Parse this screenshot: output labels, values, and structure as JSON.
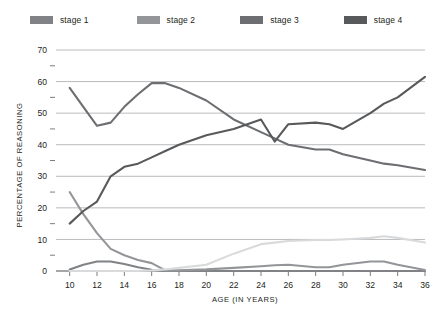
{
  "legend": {
    "position": "top",
    "items": [
      {
        "label": "stage 1",
        "color": "#808285"
      },
      {
        "label": "stage 2",
        "color": "#939598"
      },
      {
        "label": "stage 3",
        "color": "#6d6e71"
      },
      {
        "label": "stage 4",
        "color": "#58595b"
      },
      {
        "label": "stage 5",
        "color": "#d9dadb"
      }
    ]
  },
  "axes": {
    "y_title": "PERCENTAGE OF REASONING",
    "x_title": "AGE (IN YEARS)",
    "y_ticks": [
      "0",
      "10",
      "20",
      "30",
      "40",
      "50",
      "60",
      "70"
    ],
    "x_ticks": [
      "10",
      "12",
      "14",
      "16",
      "18",
      "20",
      "22",
      "24",
      "26",
      "28",
      "30",
      "32",
      "34",
      "36"
    ]
  },
  "chart_data": {
    "type": "line",
    "title": "",
    "xlabel": "AGE (IN YEARS)",
    "ylabel": "PERCENTAGE OF REASONING",
    "xlim": [
      9,
      36
    ],
    "ylim": [
      0,
      70
    ],
    "grid": true,
    "legend_position": "top",
    "x": [
      10,
      11,
      12,
      13,
      14,
      15,
      16,
      17,
      18,
      20,
      22,
      24,
      25,
      26,
      28,
      29,
      30,
      32,
      33,
      34,
      36
    ],
    "series": [
      {
        "name": "stage 1",
        "color": "#808285",
        "values": [
          0.5,
          2.0,
          3.0,
          3.0,
          2.2,
          1.2,
          0.4,
          0.0,
          0.0,
          0.0,
          0.0,
          0.0,
          0.0,
          0.0,
          0.0,
          0.0,
          0.0,
          0.0,
          0.0,
          0.0,
          0.0
        ]
      },
      {
        "name": "stage 2",
        "color": "#939598",
        "values": [
          25.0,
          18.0,
          12.0,
          7.0,
          5.0,
          3.5,
          2.5,
          0.2,
          0.2,
          0.5,
          1.0,
          1.5,
          1.8,
          2.0,
          1.2,
          1.2,
          2.0,
          3.0,
          3.0,
          2.0,
          0.3
        ]
      },
      {
        "name": "stage 3",
        "color": "#6d6e71",
        "values": [
          58.0,
          52.0,
          46.0,
          47.0,
          52.0,
          56.0,
          59.5,
          59.5,
          58.0,
          54.0,
          48.0,
          44.0,
          42.0,
          40.0,
          38.5,
          38.5,
          37.0,
          35.0,
          34.0,
          33.5,
          32.0
        ]
      },
      {
        "name": "stage 4",
        "color": "#58595b",
        "values": [
          15.0,
          19.0,
          22.0,
          30.0,
          33.0,
          34.0,
          36.0,
          38.0,
          40.0,
          43.0,
          45.0,
          48.0,
          41.0,
          46.5,
          47.0,
          46.5,
          45.0,
          50.0,
          53.0,
          55.0,
          61.5
        ]
      },
      {
        "name": "stage 5",
        "color": "#d9dadb",
        "values": [
          0.0,
          0.0,
          0.0,
          0.0,
          0.0,
          0.0,
          0.2,
          0.5,
          1.0,
          2.0,
          5.5,
          8.5,
          9.0,
          9.5,
          9.8,
          9.8,
          10.0,
          10.5,
          11.0,
          10.5,
          9.0
        ]
      }
    ]
  }
}
